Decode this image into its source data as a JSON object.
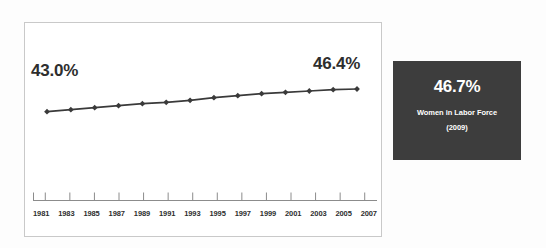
{
  "chart_data": {
    "type": "line",
    "title": "",
    "xlabel": "",
    "ylabel": "",
    "grid": false,
    "legend": "none",
    "categories": [
      "1981",
      "1983",
      "1985",
      "1987",
      "1989",
      "1991",
      "1993",
      "1995",
      "1997",
      "1999",
      "2001",
      "2003",
      "2005",
      "2007"
    ],
    "values": [
      43.0,
      43.3,
      43.6,
      43.9,
      44.2,
      44.4,
      44.7,
      45.1,
      45.4,
      45.7,
      45.9,
      46.1,
      46.3,
      46.4
    ],
    "ylim": [
      42.5,
      47.0
    ],
    "annotations": [
      {
        "text": "43.0%",
        "position": "start"
      },
      {
        "text": "46.4%",
        "position": "end"
      }
    ],
    "series_color": "#3a3a3a",
    "marker": "diamond"
  },
  "axis": {
    "tick_labels": [
      "1981",
      "1983",
      "1985",
      "1987",
      "1989",
      "1991",
      "1993",
      "1995",
      "1997",
      "1999",
      "2001",
      "2003",
      "2005",
      "2007"
    ]
  },
  "labels": {
    "start_value": "43.0%",
    "end_value": "46.4%"
  },
  "stat_panel": {
    "value": "46.7%",
    "caption": "Women in Labor Force",
    "year": "(2009)",
    "background_color": "#3d3d3d",
    "text_color": "#ffffff"
  },
  "colors": {
    "page_background": "#fdfdfd",
    "chart_background": "#ffffff",
    "chart_border": "#c9c9c9",
    "line": "#3a3a3a",
    "axis": "#8c8c8c",
    "text": "#2e2e2e"
  }
}
